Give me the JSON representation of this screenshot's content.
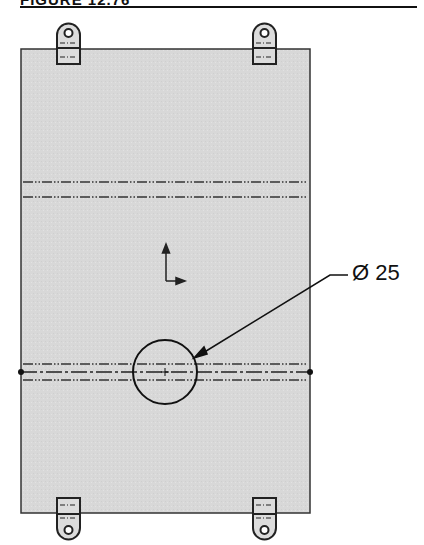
{
  "figure": {
    "title": "FIGURE 12.76"
  },
  "drawing": {
    "plate_fill": "#d9d9d9",
    "line_color": "#222222",
    "hole_dimension": {
      "symbol": "Ø",
      "value": "25",
      "label": "Ø 25"
    },
    "lugs": [
      "top-left-lug",
      "top-right-lug",
      "bottom-left-lug",
      "bottom-right-lug"
    ],
    "origin_marker": "coordinate-origin-arrows"
  }
}
